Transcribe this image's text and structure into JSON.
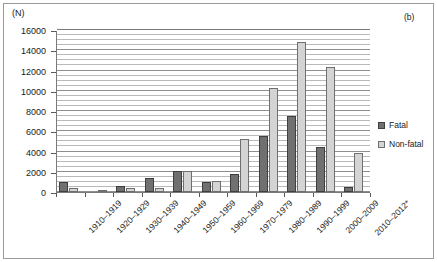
{
  "figure": {
    "panel_label": "(b)",
    "unit_label": "(N)"
  },
  "chart_data": {
    "type": "bar",
    "title": "",
    "xlabel": "",
    "ylabel": "(N)",
    "ylim": [
      0,
      16000
    ],
    "ytick_values": [
      0,
      2000,
      4000,
      6000,
      8000,
      10000,
      12000,
      14000,
      16000
    ],
    "ytick_labels": [
      "0",
      "2000",
      "4000",
      "6000",
      "8000",
      "10000",
      "12000",
      "14000",
      "16000"
    ],
    "minor_gridline_step": 500,
    "grid": true,
    "legend_position": "right",
    "categories": [
      "1910–1919",
      "1920–1929",
      "1930–1939",
      "1940–1949",
      "1950–1959",
      "1960–1969",
      "1970–1979",
      "1980–1989",
      "1990–1999",
      "2000–2009",
      "2010–2012*"
    ],
    "series": [
      {
        "name": "Fatal",
        "color": "#707070",
        "values": [
          1000,
          0,
          550,
          1400,
          2100,
          1000,
          1800,
          5500,
          7500,
          4400,
          500
        ]
      },
      {
        "name": "Non-fatal",
        "color": "#d4d4d4",
        "values": [
          400,
          150,
          400,
          400,
          2100,
          1100,
          5200,
          10300,
          14800,
          12300,
          3900
        ]
      }
    ]
  },
  "legend": {
    "items": [
      {
        "label": "Fatal"
      },
      {
        "label": "Non-fatal"
      }
    ]
  }
}
